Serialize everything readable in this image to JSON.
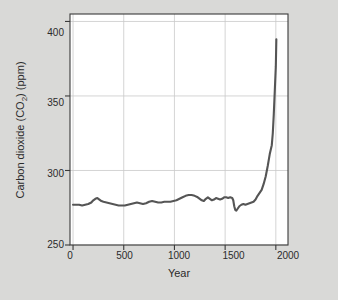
{
  "figure": {
    "background_color": "#d9d9d7",
    "plot_background_color": "#ffffff",
    "border_color": "#3a3a3a",
    "grid_color": "#c9c9c9",
    "line_color": "#555555"
  },
  "labels": {
    "ylabel_part1": "Carbon dioxide (CO",
    "ylabel_sub": "2",
    "ylabel_part2": ") (ppm)",
    "xlabel": "Year",
    "ytick_400": "400",
    "ytick_350": "350",
    "ytick_300": "300",
    "ytick_250": "250",
    "xtick_0": "0",
    "xtick_500": "500",
    "xtick_1000": "1000",
    "xtick_1500": "1500",
    "xtick_2000": "2000"
  },
  "chart_data": {
    "type": "line",
    "title": "",
    "xlabel": "Year",
    "ylabel": "Carbon dioxide (CO2) (ppm)",
    "xlim": [
      -30,
      2120
    ],
    "ylim": [
      250,
      405
    ],
    "xticks": [
      0,
      500,
      1000,
      1500,
      2000
    ],
    "yticks": [
      250,
      300,
      350,
      400
    ],
    "grid": true,
    "legend": false,
    "series": [
      {
        "name": "Atmospheric CO2",
        "x": [
          0,
          30,
          60,
          90,
          120,
          150,
          180,
          200,
          220,
          240,
          260,
          280,
          300,
          330,
          360,
          390,
          420,
          450,
          480,
          510,
          540,
          570,
          600,
          630,
          660,
          690,
          720,
          750,
          780,
          810,
          840,
          870,
          900,
          930,
          960,
          990,
          1020,
          1050,
          1080,
          1110,
          1140,
          1170,
          1200,
          1230,
          1250,
          1270,
          1290,
          1310,
          1330,
          1350,
          1370,
          1390,
          1410,
          1430,
          1450,
          1470,
          1490,
          1510,
          1530,
          1550,
          1570,
          1580,
          1590,
          1600,
          1610,
          1620,
          1640,
          1660,
          1680,
          1700,
          1720,
          1740,
          1760,
          1780,
          1800,
          1820,
          1840,
          1860,
          1880,
          1900,
          1920,
          1940,
          1960,
          1970,
          1980,
          1990,
          2000,
          2005
        ],
        "y": [
          277,
          277,
          277,
          276.5,
          277,
          277.5,
          278.5,
          280,
          281,
          281.5,
          280.5,
          279.5,
          279,
          278.5,
          278,
          277.5,
          277,
          276.5,
          276.5,
          276.5,
          277,
          277.5,
          278,
          278.5,
          278,
          277.5,
          278,
          279,
          279.5,
          279,
          278.5,
          278.5,
          279,
          279,
          279,
          279.5,
          280,
          281,
          282,
          283,
          283.5,
          283.5,
          283,
          282,
          281,
          280,
          279.5,
          281,
          282,
          281,
          280,
          280.5,
          281.5,
          281,
          280.5,
          281,
          282,
          282,
          281.5,
          282,
          281.5,
          280,
          276,
          273.5,
          273,
          274,
          276,
          277,
          277.5,
          277,
          277.5,
          278,
          278.5,
          279,
          280.5,
          283,
          285,
          287,
          291,
          296,
          303,
          311,
          317,
          325,
          338,
          354,
          370,
          388
        ]
      }
    ]
  }
}
